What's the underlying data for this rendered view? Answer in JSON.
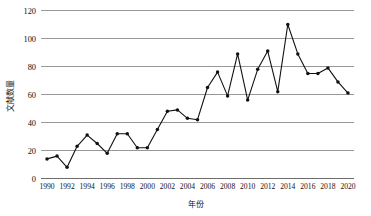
{
  "chart_data": {
    "type": "line",
    "title": "",
    "xlabel": "年份",
    "ylabel": "文献数量",
    "xlim": [
      1989.4,
      2020.6
    ],
    "ylim": [
      0,
      120
    ],
    "grid": true,
    "legend": "none",
    "marker": "filled-circle",
    "line_color": "#111111",
    "marker_color": "#111111",
    "grid_color": "#8d8d8d",
    "background_color": "#ffffff",
    "y_ticks": [
      0,
      20,
      40,
      60,
      80,
      100,
      120
    ],
    "y_tick_labels": [
      "0",
      "20",
      "40",
      "60",
      "80",
      "100",
      "120"
    ],
    "x_ticks": [
      1990,
      1992,
      1994,
      1996,
      1998,
      2000,
      2002,
      2004,
      2006,
      2008,
      2010,
      2012,
      2014,
      2016,
      2018,
      2020
    ],
    "x_tick_labels": [
      "1990",
      "1992",
      "1994",
      "1996",
      "1998",
      "2000",
      "2002",
      "2004",
      "2006",
      "2008",
      "2010",
      "2012",
      "2014",
      "2016",
      "2018",
      "2020"
    ],
    "x": [
      1990,
      1991,
      1992,
      1993,
      1994,
      1995,
      1996,
      1997,
      1998,
      1999,
      2000,
      2001,
      2002,
      2003,
      2004,
      2005,
      2006,
      2007,
      2008,
      2009,
      2010,
      2011,
      2012,
      2013,
      2014,
      2015,
      2016,
      2017,
      2018,
      2019,
      2020
    ],
    "values": [
      14,
      16,
      8,
      23,
      31,
      25,
      18,
      32,
      32,
      22,
      22,
      35,
      48,
      49,
      43,
      42,
      65,
      76,
      59,
      89,
      56,
      78,
      91,
      62,
      110,
      89,
      75,
      75,
      79,
      69,
      61
    ],
    "series": [
      {
        "name": "文献数量",
        "values": [
          14,
          16,
          8,
          23,
          31,
          25,
          18,
          32,
          32,
          22,
          22,
          35,
          48,
          49,
          43,
          42,
          65,
          76,
          59,
          89,
          56,
          78,
          91,
          62,
          110,
          89,
          75,
          75,
          79,
          69,
          61
        ]
      }
    ]
  }
}
